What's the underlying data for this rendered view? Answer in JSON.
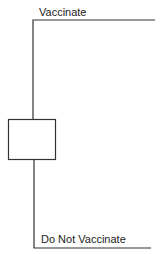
{
  "diagram": {
    "type": "decision-tree",
    "decision_node": {
      "shape": "square",
      "label": ""
    },
    "branches": [
      {
        "label": "Vaccinate"
      },
      {
        "label": "Do Not Vaccinate"
      }
    ],
    "colors": {
      "line": "#333333",
      "background": "#ffffff"
    }
  }
}
